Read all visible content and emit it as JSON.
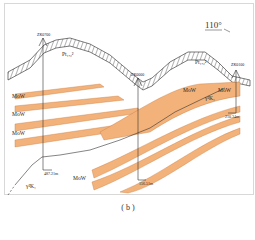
{
  "figure": {
    "caption": "( b )",
    "direction": "110°",
    "boreholes": [
      {
        "id": "ZK0700",
        "depth": "487.21m"
      },
      {
        "id": "ZK0000",
        "depth": "156.51m"
      },
      {
        "id": "ZK0100",
        "depth": "210.34m"
      }
    ],
    "strata": {
      "cover": "Pt₁,₂²",
      "ore_layer": "MoW",
      "intrusion": "γ²K₁"
    },
    "colors": {
      "ore_band": "#f3b27a",
      "ore_edge": "#c77a3c",
      "line": "#333333",
      "frame": "#d8d8d8"
    }
  }
}
